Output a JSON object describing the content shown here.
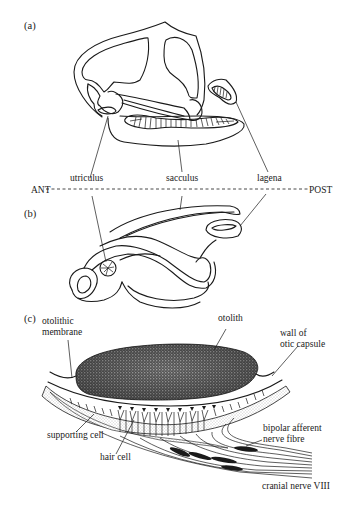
{
  "figure": {
    "panels": {
      "a": "(a)",
      "b": "(b)",
      "c": "(c)"
    },
    "axis": {
      "left": "ANT",
      "right": "POST"
    },
    "labels_ab": {
      "utriculus": "utriculus",
      "sacculus": "sacculus",
      "lagena": "lagena"
    },
    "labels_c": {
      "otolithic_membrane_line1": "otolithic",
      "otolithic_membrane_line2": "membrane",
      "otolith": "otolith",
      "wall_line1": "wall of",
      "wall_line2": "otic capsule",
      "supporting_cell": "supporting cell",
      "hair_cell": "hair cell",
      "bipolar_line1": "bipolar afferent",
      "bipolar_line2": "nerve fibre",
      "cranial_nerve": "cranial nerve VIII"
    },
    "colors": {
      "ink": "#1a1a1a",
      "background": "#ffffff",
      "stipple": "#9a9a9a"
    }
  }
}
